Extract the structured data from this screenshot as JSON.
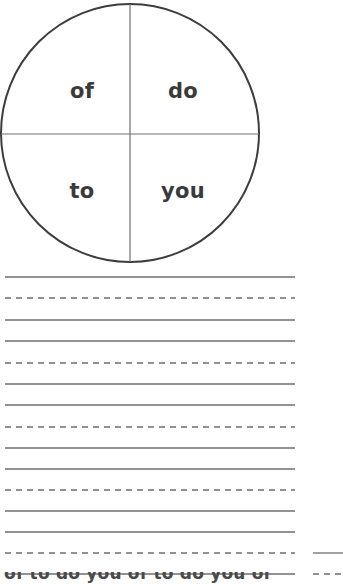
{
  "worksheet": {
    "title": "Sight Word Spinner Handwriting Worksheet",
    "background_color": "#ffffff"
  },
  "spinner": {
    "name": "word-wheel",
    "shape": "circle",
    "center_x": 130,
    "center_y": 133,
    "radius": 129,
    "outline_color": "#3d3d3d",
    "outline_width": 2,
    "divider_color": "#707070",
    "divider_width": 1.2,
    "text_color": "#3a3a3a",
    "quadrants": [
      {
        "id": "top-left",
        "label": "of",
        "cx": 82,
        "cy": 90
      },
      {
        "id": "top-right",
        "label": "do",
        "cx": 183,
        "cy": 90
      },
      {
        "id": "bottom-left",
        "label": "to",
        "cx": 82,
        "cy": 190
      },
      {
        "id": "bottom-right",
        "label": "you",
        "cx": 183,
        "cy": 190
      }
    ]
  },
  "writing_area": {
    "line_color": "#6e6e6e",
    "line_width": 1.3,
    "dash_pattern": "6 5",
    "left_x": 5,
    "right_x": 295,
    "lines": [
      {
        "y": 277,
        "style": "solid"
      },
      {
        "y": 298,
        "style": "dashed"
      },
      {
        "y": 320,
        "style": "solid"
      },
      {
        "y": 341,
        "style": "solid"
      },
      {
        "y": 363,
        "style": "dashed"
      },
      {
        "y": 384,
        "style": "solid"
      },
      {
        "y": 405,
        "style": "solid"
      },
      {
        "y": 427,
        "style": "dashed"
      },
      {
        "y": 448,
        "style": "solid"
      },
      {
        "y": 469,
        "style": "solid"
      },
      {
        "y": 490,
        "style": "dashed"
      },
      {
        "y": 511,
        "style": "solid"
      },
      {
        "y": 532,
        "style": "solid"
      },
      {
        "y": 553,
        "style": "dashed"
      },
      {
        "y": 574,
        "style": "solid"
      }
    ]
  },
  "second_column": {
    "line_color": "#6e6e6e",
    "line_width": 1.3,
    "left_x": 313,
    "right_x": 343,
    "lines": [
      {
        "y": 553,
        "style": "solid"
      },
      {
        "y": 574,
        "style": "dashed"
      }
    ]
  },
  "bottom_clipped_row": {
    "text": "of to do you of to do you of",
    "visible": "partial"
  }
}
